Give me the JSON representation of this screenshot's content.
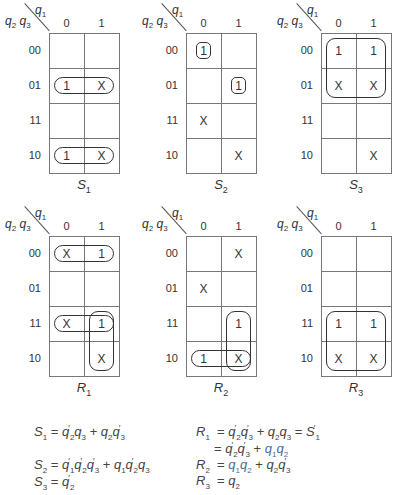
{
  "col_values": [
    "0",
    "1"
  ],
  "row_values": [
    "00",
    "01",
    "11",
    "10"
  ],
  "axis": {
    "col_var": "q1",
    "row_vars": "q2 q3"
  },
  "maps": [
    {
      "id": "S1",
      "label": "S",
      "sub": "1",
      "x": 0,
      "y": 0,
      "cells": [
        [
          "",
          ""
        ],
        [
          "1",
          "X"
        ],
        [
          "",
          ""
        ],
        [
          "1",
          "X"
        ]
      ],
      "loops": [
        {
          "r0": 1,
          "c0": 0,
          "r1": 1,
          "c1": 1
        },
        {
          "r0": 3,
          "c0": 0,
          "r1": 3,
          "c1": 1
        }
      ]
    },
    {
      "id": "S2",
      "label": "S",
      "sub": "2",
      "x": 137,
      "y": 0,
      "cells": [
        [
          "1",
          ""
        ],
        [
          "",
          "1"
        ],
        [
          "X",
          ""
        ],
        [
          "",
          "X"
        ]
      ],
      "loops": [
        {
          "r0": 0,
          "c0": 0,
          "r1": 0,
          "c1": 0,
          "small": true
        },
        {
          "r0": 1,
          "c0": 1,
          "r1": 1,
          "c1": 1,
          "small": true
        }
      ]
    },
    {
      "id": "S3",
      "label": "S",
      "sub": "3",
      "x": 272,
      "y": 0,
      "cells": [
        [
          "1",
          "1"
        ],
        [
          "X",
          "X"
        ],
        [
          "",
          ""
        ],
        [
          "",
          "X"
        ]
      ],
      "loops": [
        {
          "r0": 0,
          "c0": 0,
          "r1": 1,
          "c1": 1
        }
      ]
    },
    {
      "id": "R1",
      "label": "R",
      "sub": "1",
      "x": 0,
      "y": 203,
      "cells": [
        [
          "X",
          "1"
        ],
        [
          "",
          ""
        ],
        [
          "X",
          "1"
        ],
        [
          "",
          "X"
        ]
      ],
      "loops": [
        {
          "r0": 0,
          "c0": 0,
          "r1": 0,
          "c1": 1
        },
        {
          "r0": 2,
          "c0": 0,
          "r1": 2,
          "c1": 1
        },
        {
          "r0": 2,
          "c0": 1,
          "r1": 3,
          "c1": 1
        }
      ]
    },
    {
      "id": "R2",
      "label": "R",
      "sub": "2",
      "x": 137,
      "y": 203,
      "cells": [
        [
          "",
          "X"
        ],
        [
          "X",
          ""
        ],
        [
          "",
          "1"
        ],
        [
          "1",
          "X"
        ]
      ],
      "loops": [
        {
          "r0": 2,
          "c0": 1,
          "r1": 3,
          "c1": 1
        },
        {
          "r0": 3,
          "c0": 0,
          "r1": 3,
          "c1": 1
        }
      ]
    },
    {
      "id": "R3",
      "label": "R",
      "sub": "3",
      "x": 272,
      "y": 203,
      "cells": [
        [
          "",
          ""
        ],
        [
          "",
          ""
        ],
        [
          "1",
          "1"
        ],
        [
          "X",
          "X"
        ]
      ],
      "loops": [
        {
          "r0": 2,
          "c0": 0,
          "r1": 3,
          "c1": 1
        }
      ]
    }
  ],
  "equations": {
    "S1": "S1 = q2'q3 + q2q3'",
    "S2": "S2 = q1'q2'q3' + q1q2'q3",
    "S3": "S3 = q2'",
    "R1_line1": "R1 = q2'q3' + q2q3 = S1'",
    "R1_line2": "= q2'q3' + q1q2",
    "R2": "R2 = q1q2 + q2q3'",
    "R3": "R3 = q2"
  }
}
